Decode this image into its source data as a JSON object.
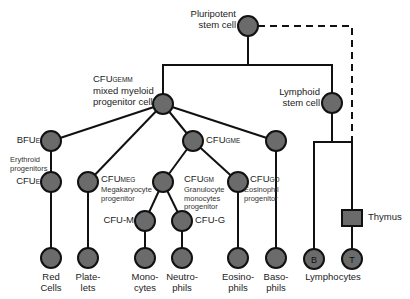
{
  "diagram": {
    "node_color": "#6b6b6b",
    "line_color": "#111111",
    "nodes": {
      "pluripotent": {
        "label": "Pluripotent\nstem cell"
      },
      "cfu_gemm": {
        "main": "CFU",
        "sub": "GEMM",
        "desc": "mixed myeloid\nprogenitor cell"
      },
      "lymphoid": {
        "label": "Lymphoid\nstem cell"
      },
      "bfu_e": {
        "main": "BFU",
        "sub": "E"
      },
      "erythroid_note": "Erythroid\nprogenitors",
      "cfu_e": {
        "main": "CFU",
        "sub": "E"
      },
      "cfu_meg": {
        "main": "CFU",
        "sub": "MEG",
        "desc": "Megakaryocyte\nprogenitor"
      },
      "cfu_gme": {
        "main": "CFU",
        "sub": "GME"
      },
      "cfu_gm": {
        "main": "CFU",
        "sub": "GM",
        "desc": "Granulocyte\nmonocytes\nprogenitor"
      },
      "cfu_eo": {
        "main": "CFU",
        "sub": "GO",
        "desc": "Eosinophil\nprogenitor"
      },
      "cfu_m": {
        "label": "CFU-M"
      },
      "cfu_g": {
        "label": "CFU-G"
      },
      "thymus": {
        "label": "Thymus"
      },
      "b_cell": {
        "letter": "B"
      },
      "t_cell": {
        "letter": "T"
      }
    },
    "mature_cells": [
      {
        "id": "red-cells",
        "label": "Red\nCells"
      },
      {
        "id": "platelets",
        "label": "Plate-\nlets"
      },
      {
        "id": "monocytes",
        "label": "Mono-\ncytes"
      },
      {
        "id": "neutrophils",
        "label": "Neutro-\nphils"
      },
      {
        "id": "eosinophils",
        "label": "Eosino-\nphils"
      },
      {
        "id": "basophils",
        "label": "Baso-\nphils"
      }
    ],
    "lymphocytes_label": "Lymphocytes"
  }
}
